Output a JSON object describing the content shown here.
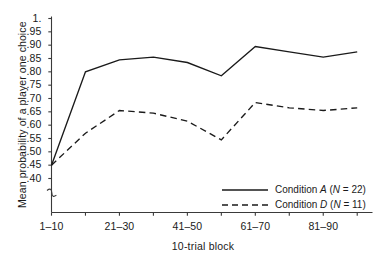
{
  "chart_data": {
    "type": "line",
    "title": "",
    "xlabel": "10-trial block",
    "ylabel": "Mean probability of a player one choice",
    "categories": [
      "1-10",
      "11-20",
      "21-30",
      "31-40",
      "41-50",
      "51-60",
      "61-70",
      "71-80",
      "81-90",
      "91-100"
    ],
    "x_tick_labels": [
      "1–10",
      "",
      "21–30",
      "",
      "41–50",
      "",
      "61–70",
      "",
      "81–90",
      ""
    ],
    "y_tick_labels": [
      "1.",
      ".95",
      ".90",
      ".85",
      ".80",
      ".75",
      ".70",
      ".65",
      ".60",
      ".55",
      ".50",
      ".45",
      ".40"
    ],
    "y_tick_values": [
      1.0,
      0.95,
      0.9,
      0.85,
      0.8,
      0.75,
      0.7,
      0.65,
      0.6,
      0.55,
      0.5,
      0.45,
      0.4
    ],
    "ylim": [
      0.4,
      1.0
    ],
    "y_axis_break": true,
    "grid": false,
    "legend_position": "lower-right",
    "series": [
      {
        "name": "Condition A (N = 22)",
        "label_main": "Condition",
        "label_letter": "A",
        "label_n": "(N = 22)",
        "style": "solid",
        "color": "#1a1a1a",
        "values": [
          0.45,
          0.8,
          0.845,
          0.855,
          0.835,
          0.785,
          0.895,
          0.875,
          0.855,
          0.875
        ]
      },
      {
        "name": "Condition D (N = 11)",
        "label_main": "Condition",
        "label_letter": "D",
        "label_n": "(N = 11)",
        "style": "dashed",
        "color": "#1a1a1a",
        "values": [
          0.45,
          0.57,
          0.655,
          0.645,
          0.615,
          0.545,
          0.685,
          0.665,
          0.655,
          0.665
        ]
      }
    ]
  },
  "colors": {
    "background": "#ffffff",
    "axis": "#3a3a3a",
    "ink": "#1a1a1a"
  }
}
